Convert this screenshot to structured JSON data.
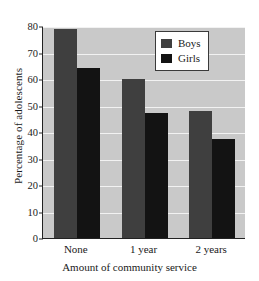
{
  "chart_data": {
    "type": "bar",
    "title": "",
    "xlabel": "Amount of community service",
    "ylabel": "Percentage of adolescents",
    "categories": [
      "None",
      "1 year",
      "2 years"
    ],
    "series": [
      {
        "name": "Boys",
        "values": [
          79,
          60,
          48
        ],
        "color": "#3f3f3f"
      },
      {
        "name": "Girls",
        "values": [
          64,
          47,
          37.5
        ],
        "color": "#131313"
      }
    ],
    "ylim": [
      0,
      80
    ],
    "yticks": [
      0,
      10,
      20,
      30,
      40,
      50,
      60,
      70,
      80
    ],
    "ytick_labels": [
      "0",
      "10",
      "20",
      "30",
      "40",
      "50",
      "60",
      "70",
      "80"
    ],
    "grid": true,
    "legend_position": "top-right",
    "plot_background": "#c9c9c9",
    "gridline_color": "#f2f2f2",
    "axis_color": "#222222",
    "page_background": "#ffffff"
  },
  "legend": {
    "entries": [
      {
        "label": "Boys",
        "color": "#3f3f3f"
      },
      {
        "label": "Girls",
        "color": "#131313"
      }
    ]
  }
}
